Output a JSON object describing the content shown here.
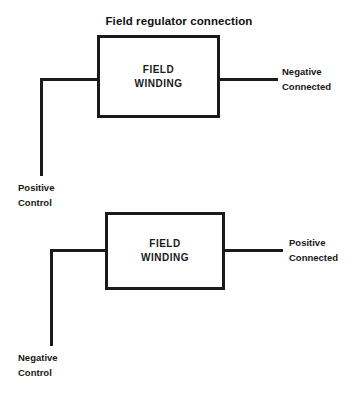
{
  "diagram": {
    "title": "Field regulator connection",
    "background_color": "#ffffff",
    "line_color": "#1a1a1a",
    "text_color": "#141414",
    "blocks": [
      {
        "id": "top",
        "line1": "FIELD",
        "line2": "WINDING",
        "left_terminal": {
          "primary": "Positive",
          "secondary": "Control"
        },
        "right_terminal": {
          "primary": "Negative",
          "secondary": "Connected"
        }
      },
      {
        "id": "bottom",
        "line1": "FIELD",
        "line2": "WINDING",
        "left_terminal": {
          "primary": "Negative",
          "secondary": "Control"
        },
        "right_terminal": {
          "primary": "Positive",
          "secondary": "Connected"
        }
      }
    ]
  }
}
